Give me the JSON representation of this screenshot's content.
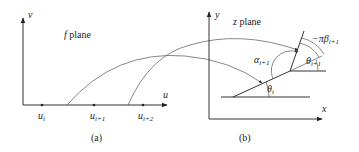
{
  "panel_a": {
    "v_axis_label": "v",
    "u_axis_label": "u",
    "plane_title": "f plane",
    "plane_var": "f",
    "plane_word": "plane",
    "points": [
      {
        "base": "u",
        "sub": "i"
      },
      {
        "base": "u",
        "sub": "i+1"
      },
      {
        "base": "u",
        "sub": "i+2"
      }
    ],
    "caption": "(a)"
  },
  "panel_b": {
    "y_axis_label": "y",
    "x_axis_label": "x",
    "plane_title": "z plane",
    "plane_var": "z",
    "plane_word": "plane",
    "angles": {
      "alpha": {
        "base": "α",
        "sub": "i+1"
      },
      "theta_i": {
        "base": "θ",
        "sub": "i"
      },
      "theta_i1": {
        "base": "θ",
        "sub": "i+1"
      },
      "beta": {
        "prefix": "−π",
        "base": "β",
        "sub": "i+1"
      }
    },
    "caption": "(b)"
  },
  "colors": {
    "stroke": "#333333",
    "text": "#222222",
    "background": "#ffffff"
  }
}
